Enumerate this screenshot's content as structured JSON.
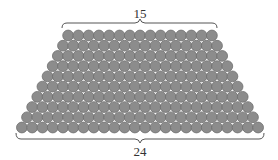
{
  "diagram": {
    "top_label": "15",
    "bottom_label": "24",
    "top_row_count": 15,
    "bottom_row_count": 24,
    "row_count": 10,
    "colors": {
      "ball_fill": "#8c8c8c",
      "ball_stroke": "#6e6e6e",
      "brace": "#555555",
      "text": "#333333"
    }
  }
}
